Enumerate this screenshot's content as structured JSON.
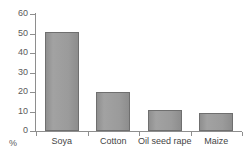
{
  "chart_data": {
    "type": "bar",
    "title": "",
    "xlabel": "",
    "ylabel": "%",
    "categories": [
      "Soya",
      "Cotton",
      "Oil seed rape",
      "Maize"
    ],
    "values": [
      51,
      20,
      11,
      9
    ],
    "ylim": [
      0,
      60
    ],
    "yticks": [
      0,
      10,
      20,
      30,
      40,
      50,
      60
    ],
    "ytick_labels": [
      "0",
      "10",
      "20",
      "30",
      "40",
      "50",
      "60"
    ],
    "grid": false,
    "legend": null,
    "series": [
      {
        "name": "",
        "values": [
          51,
          20,
          11,
          9
        ]
      }
    ],
    "colors": {
      "bar_fill": "#9b9b9b",
      "bar_border": "#6f6f6f",
      "axis": "#8e8e8e",
      "text": "#454545",
      "background": "#ffffff"
    }
  },
  "axis": {
    "unit": "%"
  }
}
